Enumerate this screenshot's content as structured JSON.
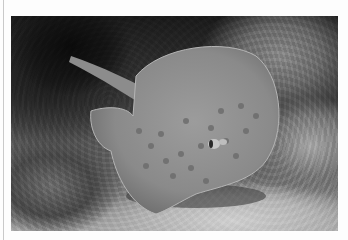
{
  "image": {
    "subject": "stingray",
    "description": "Spotted stingray resting on sandy reef bottom beside coral rocks, black and white photograph",
    "colors": {
      "background": "#fdfdfd",
      "ray_body": "#8f8f8f",
      "ray_spots": "#6f6f6f",
      "sand": "#c4c4c4",
      "shadow": "#111111"
    }
  }
}
